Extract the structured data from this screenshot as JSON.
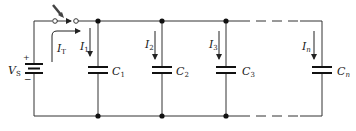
{
  "diagram": {
    "type": "parallel-capacitor-circuit",
    "colors": {
      "wire": "#333333",
      "background": "#ffffff"
    },
    "source": {
      "label": "V",
      "subscript": "S",
      "plus_sign": "+",
      "minus_sign": "−"
    },
    "switch": {
      "state": "closing",
      "arrow": "pointer-arrow"
    },
    "total_current": {
      "label": "I",
      "subscript": "T"
    },
    "branches": [
      {
        "current": "I",
        "current_sub": "1",
        "cap": "C",
        "cap_sub": "1"
      },
      {
        "current": "I",
        "current_sub": "2",
        "cap": "C",
        "cap_sub": "2"
      },
      {
        "current": "I",
        "current_sub": "3",
        "cap": "C",
        "cap_sub": "3"
      },
      {
        "current": "I",
        "current_sub": "n",
        "cap": "C",
        "cap_sub": "n"
      }
    ]
  }
}
